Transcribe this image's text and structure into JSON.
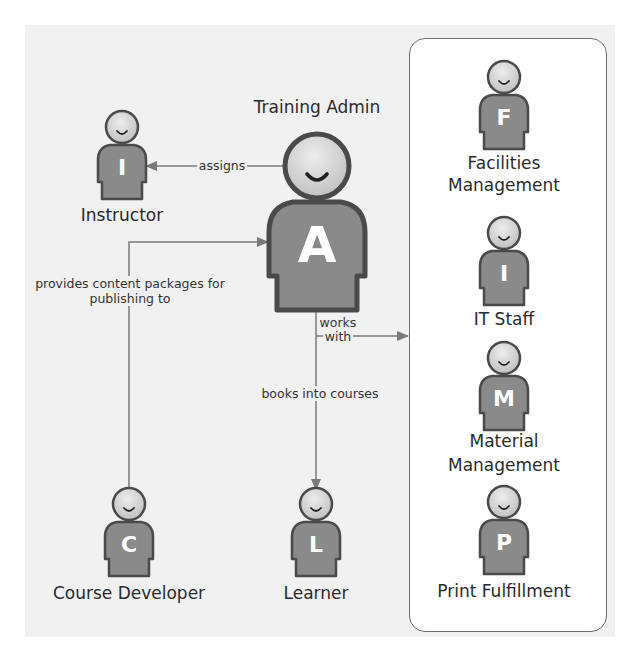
{
  "diagram": {
    "colors": {
      "background": "#f1f1f1",
      "panel_fill": "#ffffff",
      "panel_border": "#6e6e6e",
      "body_fill": "#8a8a8a",
      "outline": "#4a4a4a",
      "head_fill": "#d6d6d6",
      "line": "#7a7a7a",
      "letter": "#ffffff"
    },
    "actors": {
      "admin": {
        "name": "Training Admin",
        "letter": "A"
      },
      "instructor": {
        "name": "Instructor",
        "letter": "I"
      },
      "developer": {
        "name": "Course Developer",
        "letter": "C"
      },
      "learner": {
        "name": "Learner",
        "letter": "L"
      }
    },
    "panel": {
      "members": [
        {
          "name_line1": "Facilities",
          "name_line2": "Management",
          "letter": "F"
        },
        {
          "name_line1": "IT Staff",
          "name_line2": "",
          "letter": "I"
        },
        {
          "name_line1": "Material",
          "name_line2": "Management",
          "letter": "M"
        },
        {
          "name_line1": "Print Fulfillment",
          "name_line2": "",
          "letter": "P"
        }
      ]
    },
    "edges": {
      "assigns": "assigns",
      "provides_line1": "provides content packages for",
      "provides_line2": "publishing to",
      "works_line1": "works",
      "works_line2": "with",
      "books": "books into courses"
    }
  }
}
